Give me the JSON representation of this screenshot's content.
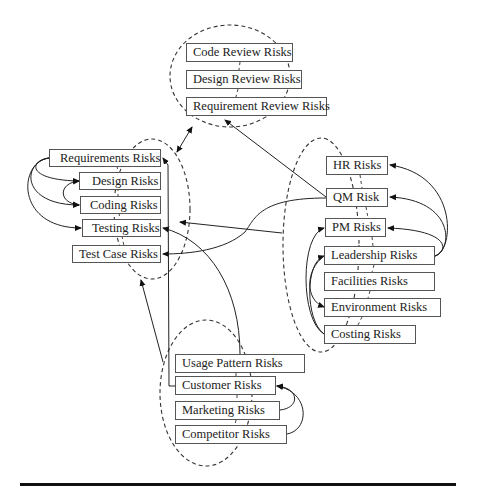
{
  "diagram": {
    "clusters": {
      "review": {
        "name": "Review Risks",
        "nodes": [
          {
            "id": "code_review",
            "label": "Code Review Risks"
          },
          {
            "id": "design_review",
            "label": "Design Review Risks"
          },
          {
            "id": "requirement_review",
            "label": "Requirement Review Risks"
          }
        ]
      },
      "development": {
        "name": "Development Risks",
        "nodes": [
          {
            "id": "requirements",
            "label": "Requirements Risks"
          },
          {
            "id": "design",
            "label": "Design Risks"
          },
          {
            "id": "coding",
            "label": "Coding Risks"
          },
          {
            "id": "testing",
            "label": "Testing Risks"
          },
          {
            "id": "test_case",
            "label": "Test Case Risks"
          }
        ]
      },
      "management": {
        "name": "Management Risks",
        "nodes": [
          {
            "id": "hr",
            "label": "HR Risks"
          },
          {
            "id": "qm",
            "label": "QM Risk"
          },
          {
            "id": "pm",
            "label": "PM Risks"
          },
          {
            "id": "leadership",
            "label": "Leadership Risks"
          },
          {
            "id": "facilities",
            "label": "Facilities Risks"
          },
          {
            "id": "environment",
            "label": "Environment Risks"
          },
          {
            "id": "costing",
            "label": "Costing Risks"
          }
        ]
      },
      "market": {
        "name": "Market Risks",
        "nodes": [
          {
            "id": "usage_pattern",
            "label": "Usage Pattern Risks"
          },
          {
            "id": "customer",
            "label": "Customer Risks"
          },
          {
            "id": "marketing",
            "label": "Marketing Risks"
          },
          {
            "id": "competitor",
            "label": "Competitor Risks"
          }
        ]
      }
    },
    "edges": [
      {
        "from": "review_cluster",
        "to": "development_cluster",
        "bidirectional": true
      },
      {
        "from": "qm",
        "to": "requirement_review"
      },
      {
        "from": "qm",
        "to": "test_case"
      },
      {
        "from": "management_cluster",
        "to": "development_cluster"
      },
      {
        "from": "usage_pattern",
        "to": "testing"
      },
      {
        "from": "customer",
        "to": "requirements"
      },
      {
        "from": "market_cluster",
        "to": "development_cluster"
      },
      {
        "from": "requirements",
        "to": "design"
      },
      {
        "from": "requirements",
        "to": "coding"
      },
      {
        "from": "requirements",
        "to": "testing"
      },
      {
        "from": "design",
        "to": "coding",
        "bidirectional": true
      },
      {
        "from": "leadership",
        "to": "hr"
      },
      {
        "from": "leadership",
        "to": "qm"
      },
      {
        "from": "leadership",
        "to": "pm"
      },
      {
        "from": "costing",
        "to": "pm"
      },
      {
        "from": "costing",
        "to": "leadership"
      },
      {
        "from": "costing",
        "to": "environment"
      },
      {
        "from": "marketing",
        "to": "customer"
      },
      {
        "from": "competitor",
        "to": "customer"
      }
    ]
  }
}
